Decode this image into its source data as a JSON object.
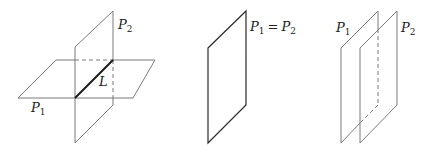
{
  "figures": [
    {
      "id": "intersecting-planes",
      "labels": {
        "plane1": {
          "base": "P",
          "sub": "1"
        },
        "plane2": {
          "base": "P",
          "sub": "2"
        },
        "line": "L"
      },
      "description": "Two planes intersecting in a line L"
    },
    {
      "id": "coincident-planes",
      "labels": {
        "plane1": {
          "base": "P",
          "sub": "1"
        },
        "equals": "=",
        "plane2": {
          "base": "P",
          "sub": "2"
        }
      },
      "description": "Two coincident planes"
    },
    {
      "id": "parallel-planes",
      "labels": {
        "plane1": {
          "base": "P",
          "sub": "1"
        },
        "plane2": {
          "base": "P",
          "sub": "2"
        }
      },
      "description": "Two parallel planes"
    }
  ],
  "colors": {
    "edge": "#7a7a7a",
    "edge_dark": "#2a2a2a",
    "line_L": "#1a1a1a",
    "text": "#222222",
    "background": "#ffffff"
  }
}
